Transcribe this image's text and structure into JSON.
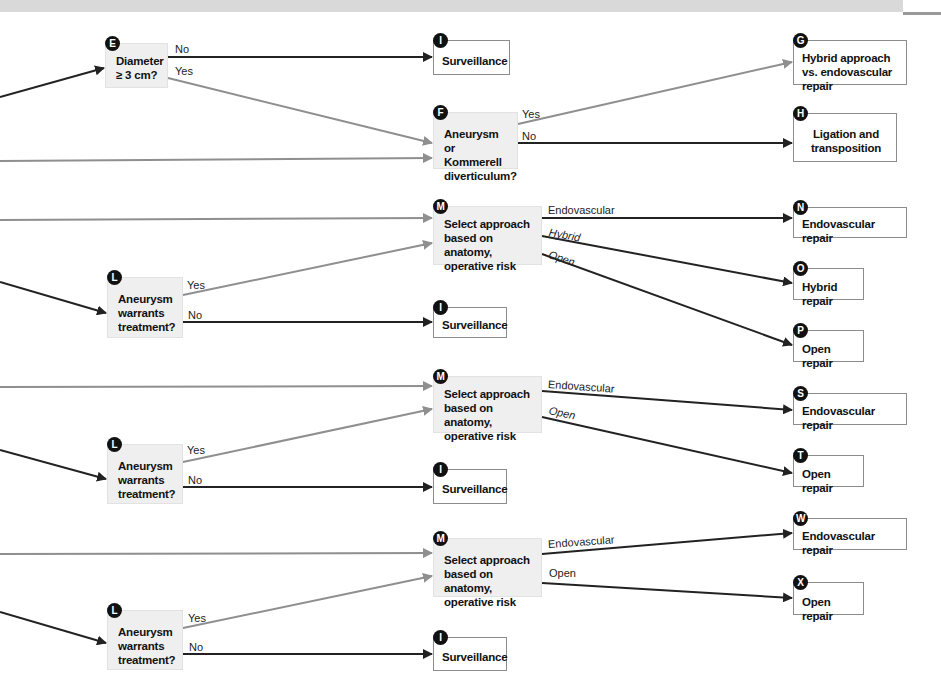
{
  "header": {
    "text": ""
  },
  "colors": {
    "decision_fill": "#efefef",
    "outcome_border": "#8c8c8c",
    "arrow_dark": "#222222",
    "arrow_gray": "#8f8f8f",
    "marker": "#111111"
  },
  "nodes": {
    "E": {
      "marker": "E",
      "text": "Diameter ≥ 3 cm?",
      "type": "decision"
    },
    "I1": {
      "marker": "I",
      "text": "Surveillance",
      "type": "outcome"
    },
    "G": {
      "marker": "G",
      "text": "Hybrid approach vs. endovascular repair",
      "type": "outcome"
    },
    "F": {
      "marker": "F",
      "text": "Aneurysm or Kommerell diverticulum?",
      "type": "decision"
    },
    "H": {
      "marker": "H",
      "text": "Ligation and transposition",
      "type": "outcome"
    },
    "M1": {
      "marker": "M",
      "text": "Select approach based on anatomy, operative risk",
      "type": "decision"
    },
    "N": {
      "marker": "N",
      "text": "Endovascular repair",
      "type": "outcome"
    },
    "O": {
      "marker": "O",
      "text": "Hybrid repair",
      "type": "outcome"
    },
    "L1": {
      "marker": "L",
      "text": "Aneurysm warrants treatment?",
      "type": "decision"
    },
    "I2": {
      "marker": "I",
      "text": "Surveillance",
      "type": "outcome"
    },
    "P": {
      "marker": "P",
      "text": "Open repair",
      "type": "outcome"
    },
    "M2": {
      "marker": "M",
      "text": "Select approach based on anatomy, operative risk",
      "type": "decision"
    },
    "S": {
      "marker": "S",
      "text": "Endovascular repair",
      "type": "outcome"
    },
    "T": {
      "marker": "T",
      "text": "Open repair",
      "type": "outcome"
    },
    "L2": {
      "marker": "L",
      "text": "Aneurysm warrants treatment?",
      "type": "decision"
    },
    "I3": {
      "marker": "I",
      "text": "Surveillance",
      "type": "outcome"
    },
    "M3": {
      "marker": "M",
      "text": "Select approach based on anatomy, operative risk",
      "type": "decision"
    },
    "W": {
      "marker": "W",
      "text": "Endovascular repair",
      "type": "outcome"
    },
    "X": {
      "marker": "X",
      "text": "Open repair",
      "type": "outcome"
    },
    "L3": {
      "marker": "L",
      "text": "Aneurysm warrants treatment?",
      "type": "decision"
    },
    "I4": {
      "marker": "I",
      "text": "Surveillance",
      "type": "outcome"
    }
  },
  "edge_labels": {
    "E_no": "No",
    "E_yes": "Yes",
    "F_yes": "Yes",
    "F_no": "No",
    "M1_endo": "Endovascular",
    "M1_hybrid": "Hybrid",
    "M1_open": "Open",
    "L1_yes": "Yes",
    "L1_no": "No",
    "M2_endo": "Endovascular",
    "M2_open": "Open",
    "L2_yes": "Yes",
    "L2_no": "No",
    "M3_endo": "Endovascular",
    "M3_open": "Open",
    "L3_yes": "Yes",
    "L3_no": "No"
  }
}
